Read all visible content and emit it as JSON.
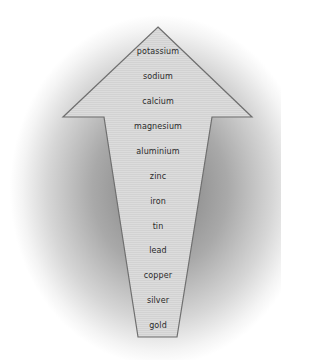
{
  "diagram": {
    "type": "arrow-ranking",
    "direction": "up",
    "colors": {
      "arrow_fill": "#d9d9d9",
      "arrow_stroke": "#6f6f6f",
      "background_shadow": "#7d7d7d",
      "text": "#2a2a2a"
    },
    "items": [
      {
        "label": "potassium",
        "y": 53
      },
      {
        "label": "sodium",
        "y": 78
      },
      {
        "label": "calcium",
        "y": 103
      },
      {
        "label": "magnesium",
        "y": 128
      },
      {
        "label": "aluminium",
        "y": 153
      },
      {
        "label": "zinc",
        "y": 178
      },
      {
        "label": "iron",
        "y": 203
      },
      {
        "label": "tin",
        "y": 228
      },
      {
        "label": "lead",
        "y": 252
      },
      {
        "label": "copper",
        "y": 277
      },
      {
        "label": "silver",
        "y": 302
      },
      {
        "label": "gold",
        "y": 327
      }
    ]
  }
}
